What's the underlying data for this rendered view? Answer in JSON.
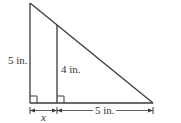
{
  "diagram": {
    "type": "similar-triangles",
    "labels": {
      "left_height": "5 in.",
      "inner_height": "4 in.",
      "base_right": "5 in.",
      "base_left_unknown": "x"
    },
    "colors": {
      "line": "#3a3a3a",
      "text": "#333333",
      "background": "#ffffff"
    }
  }
}
